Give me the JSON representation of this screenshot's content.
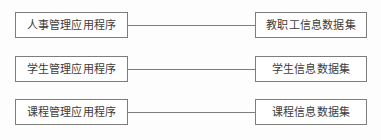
{
  "diagram": {
    "type": "relationship-diagram",
    "background_color": "#fdfdfd",
    "border_color": "#7d7d7d",
    "text_color": "#3b3b3b",
    "connector_color": "#7d7d7d",
    "rows": [
      {
        "left_node": "人事管理应用程序",
        "right_node": "教职工信息数据集",
        "connector": "line"
      },
      {
        "left_node": "学生管理应用程序",
        "right_node": "学生信息数据集",
        "connector": "line"
      },
      {
        "left_node": "课程管理应用程序",
        "right_node": "课程信息数据集",
        "connector": "line"
      }
    ]
  }
}
